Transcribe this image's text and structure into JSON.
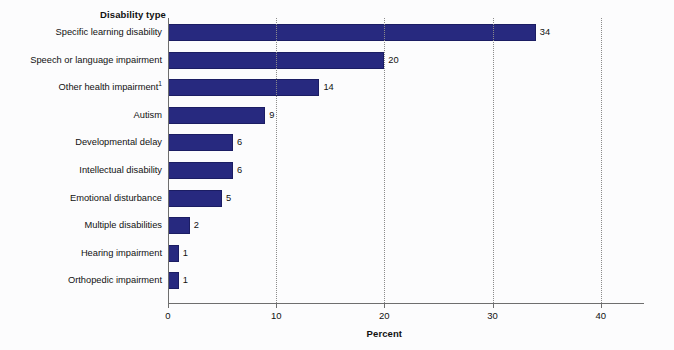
{
  "chart_data": {
    "type": "bar",
    "orientation": "horizontal",
    "title": "",
    "category_axis_header": "Disability type",
    "xlabel": "Percent",
    "ylabel": "",
    "xlim": [
      0,
      44
    ],
    "xticks": [
      0,
      10,
      20,
      30,
      40
    ],
    "xtick_labels": [
      "0",
      "10",
      "20",
      "30",
      "40"
    ],
    "grid": "vertical-dotted",
    "legend": "none",
    "bar_color": "#27297f",
    "bar_edge_color": "#1b1d63",
    "background_color": "#fcfcfd",
    "categories": [
      "Specific learning disability",
      "Speech or language impairment",
      "Other health impairment",
      "Autism",
      "Developmental delay",
      "Intellectual disability",
      "Emotional disturbance",
      "Multiple disabilities",
      "Hearing impairment",
      "Orthopedic impairment"
    ],
    "values": [
      34,
      20,
      14,
      9,
      6,
      6,
      5,
      2,
      1,
      1
    ],
    "data_labels": [
      "34",
      "20",
      "14",
      "9",
      "6",
      "6",
      "5",
      "2",
      "1",
      "1"
    ],
    "footnote_markers": [
      "",
      "",
      "1",
      "",
      "",
      "",
      "",
      "",
      "",
      ""
    ],
    "bars": [
      {
        "label": "Specific learning disability",
        "footnote": "",
        "value": 34,
        "data_label": "34"
      },
      {
        "label": "Speech or language impairment",
        "footnote": "",
        "value": 20,
        "data_label": "20"
      },
      {
        "label": "Other health impairment",
        "footnote": "1",
        "value": 14,
        "data_label": "14"
      },
      {
        "label": "Autism",
        "footnote": "",
        "value": 9,
        "data_label": "9"
      },
      {
        "label": "Developmental delay",
        "footnote": "",
        "value": 6,
        "data_label": "6"
      },
      {
        "label": "Intellectual disability",
        "footnote": "",
        "value": 6,
        "data_label": "6"
      },
      {
        "label": "Emotional disturbance",
        "footnote": "",
        "value": 5,
        "data_label": "5"
      },
      {
        "label": "Multiple disabilities",
        "footnote": "",
        "value": 2,
        "data_label": "2"
      },
      {
        "label": "Hearing impairment",
        "footnote": "",
        "value": 1,
        "data_label": "1"
      },
      {
        "label": "Orthopedic impairment",
        "footnote": "",
        "value": 1,
        "data_label": "1"
      }
    ]
  }
}
